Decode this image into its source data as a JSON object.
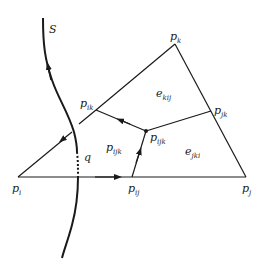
{
  "diagram": {
    "stroke_color": "#1a1a1a",
    "background": "#ffffff",
    "curve": {
      "name": "S",
      "label": "S"
    },
    "intersection": {
      "name": "q",
      "label": "q"
    },
    "vertices": {
      "p_i": {
        "base": "p",
        "sub": "i"
      },
      "p_j": {
        "base": "p",
        "sub": "j"
      },
      "p_k": {
        "base": "p",
        "sub": "k"
      },
      "p_ik": {
        "base": "p",
        "sub": "ik"
      },
      "p_jk": {
        "base": "p",
        "sub": "jk"
      },
      "p_ij": {
        "base": "p",
        "sub": "ij"
      },
      "p_ijk": {
        "base": "p",
        "sub": "ijk"
      }
    },
    "regions": {
      "left_region": {
        "base": "p",
        "sub": "ijk"
      },
      "e_kij": {
        "base": "e",
        "sub": "kij"
      },
      "e_jki": {
        "base": "e",
        "sub": "jki"
      }
    }
  }
}
